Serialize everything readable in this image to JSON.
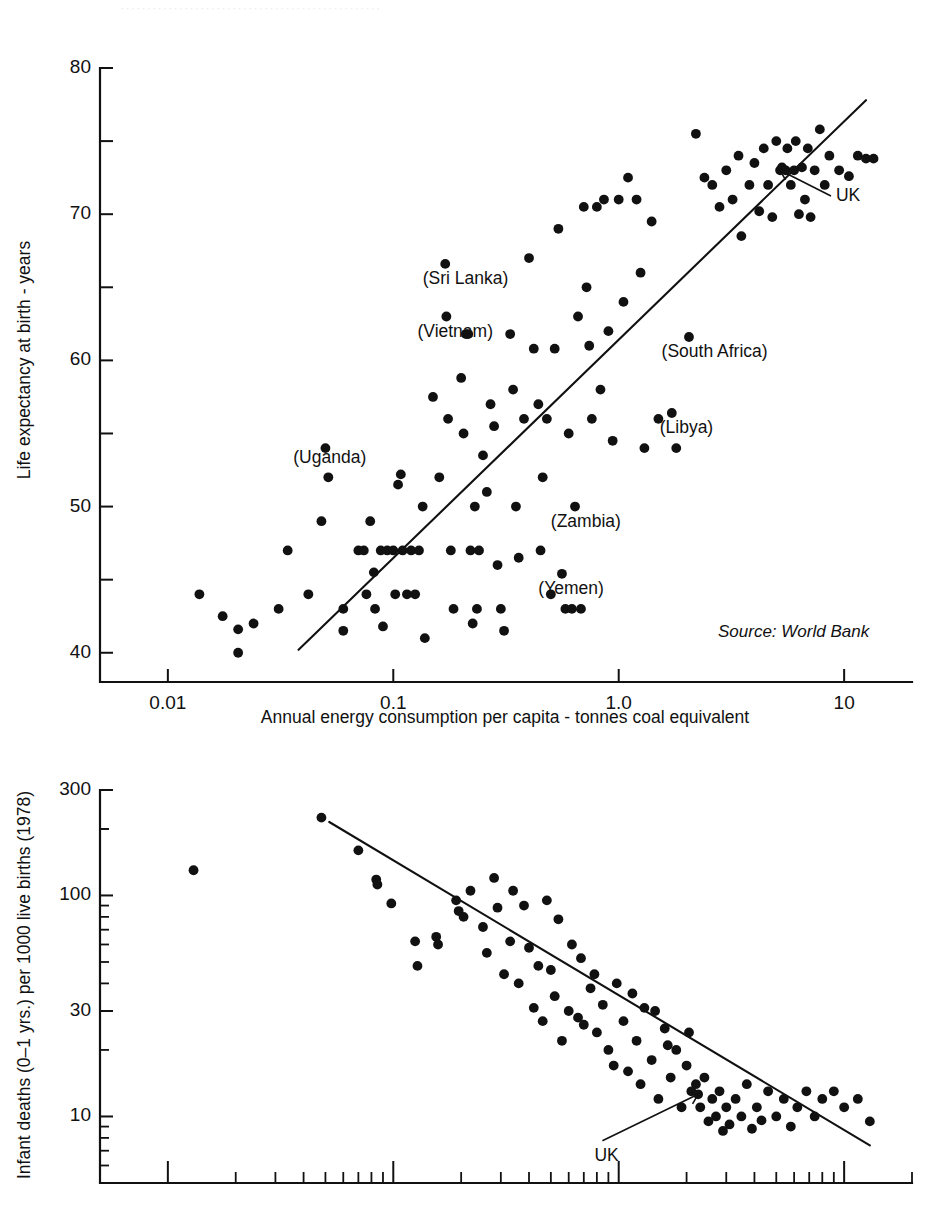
{
  "page": {
    "bleed_through_text": "·················································"
  },
  "chart_data": [
    {
      "id": "life-expectancy",
      "type": "scatter",
      "title": "",
      "xlabel": "Annual energy consumption per capita - tonnes coal equivalent",
      "ylabel": "Life expectancy at birth - years",
      "xscale": "log",
      "yscale": "linear",
      "xlim": [
        0.005,
        20
      ],
      "ylim": [
        38,
        80
      ],
      "xticks": [
        0.01,
        0.1,
        1.0,
        10
      ],
      "xticklabels": [
        "0.01",
        "0.1",
        "1.0",
        "10"
      ],
      "yticks": [
        40,
        45,
        50,
        55,
        60,
        65,
        70,
        75,
        80
      ],
      "yticklabels": [
        "40",
        "",
        "50",
        "",
        "60",
        "",
        "70",
        "",
        "80"
      ],
      "grid": false,
      "source_note": "Source: World Bank",
      "fit_line": {
        "x0": 0.038,
        "y0": 40.2,
        "x1": 12.5,
        "y1": 77.8
      },
      "annotations": [
        {
          "label": "(Sri Lanka)",
          "text_x": 0.135,
          "text_y": 65.2,
          "point_x": 0.175,
          "point_y": 66.6,
          "arrow": false
        },
        {
          "label": "(Vietnam)",
          "text_x": 0.128,
          "text_y": 61.6,
          "point_x": 0.168,
          "point_y": 63.0,
          "arrow": false
        },
        {
          "label": "(South Africa)",
          "text_x": 1.55,
          "text_y": 60.2,
          "point_x": 2.05,
          "point_y": 61.6,
          "arrow": false
        },
        {
          "label": "(Libya)",
          "text_x": 1.52,
          "text_y": 55.0,
          "point_x": 1.72,
          "point_y": 56.4,
          "arrow": false
        },
        {
          "label": "(Uganda)",
          "text_x": 0.036,
          "text_y": 53.0,
          "point_x": 0.05,
          "point_y": 54.2,
          "arrow": false
        },
        {
          "label": "(Zambia)",
          "text_x": 0.5,
          "text_y": 48.6,
          "point_x": 0.64,
          "point_y": 50.0,
          "arrow": false
        },
        {
          "label": "(Yemen)",
          "text_x": 0.44,
          "text_y": 44.0,
          "point_x": 0.56,
          "point_y": 45.4,
          "arrow": false
        },
        {
          "label": "UK",
          "text_x": 9.2,
          "text_y": 70.9,
          "point_x": 5.2,
          "point_y": 73.0,
          "arrow": true
        }
      ],
      "points": [
        [
          0.0138,
          44.0
        ],
        [
          0.0175,
          42.5
        ],
        [
          0.0205,
          41.6
        ],
        [
          0.0205,
          40.0
        ],
        [
          0.024,
          42.0
        ],
        [
          0.031,
          43.0
        ],
        [
          0.034,
          47.0
        ],
        [
          0.042,
          44.0
        ],
        [
          0.048,
          49.0
        ],
        [
          0.05,
          54.0
        ],
        [
          0.0515,
          52.0
        ],
        [
          0.06,
          43.0
        ],
        [
          0.06,
          41.5
        ],
        [
          0.07,
          47.0
        ],
        [
          0.074,
          47.0
        ],
        [
          0.076,
          44.0
        ],
        [
          0.079,
          49.0
        ],
        [
          0.082,
          45.5
        ],
        [
          0.083,
          43.0
        ],
        [
          0.088,
          47.0
        ],
        [
          0.094,
          47.0
        ],
        [
          0.1,
          47.0
        ],
        [
          0.102,
          44.0
        ],
        [
          0.105,
          51.5
        ],
        [
          0.108,
          52.2
        ],
        [
          0.11,
          47.0
        ],
        [
          0.115,
          44.0
        ],
        [
          0.12,
          47.0
        ],
        [
          0.125,
          44.0
        ],
        [
          0.13,
          47.0
        ],
        [
          0.135,
          50.0
        ],
        [
          0.138,
          41.0
        ],
        [
          0.15,
          57.5
        ],
        [
          0.17,
          66.6
        ],
        [
          0.172,
          63.0
        ],
        [
          0.175,
          56.0
        ],
        [
          0.18,
          47.0
        ],
        [
          0.185,
          43.0
        ],
        [
          0.2,
          58.8
        ],
        [
          0.205,
          55.0
        ],
        [
          0.21,
          61.8
        ],
        [
          0.215,
          61.8
        ],
        [
          0.225,
          42.0
        ],
        [
          0.235,
          43.0
        ],
        [
          0.24,
          47.0
        ],
        [
          0.25,
          53.5
        ],
        [
          0.26,
          51.0
        ],
        [
          0.27,
          57.0
        ],
        [
          0.28,
          55.5
        ],
        [
          0.29,
          46.0
        ],
        [
          0.3,
          43.0
        ],
        [
          0.31,
          41.5
        ],
        [
          0.33,
          61.8
        ],
        [
          0.34,
          58.0
        ],
        [
          0.35,
          50.0
        ],
        [
          0.38,
          56.0
        ],
        [
          0.4,
          67.0
        ],
        [
          0.42,
          60.8
        ],
        [
          0.44,
          57.0
        ],
        [
          0.46,
          52.0
        ],
        [
          0.48,
          56.0
        ],
        [
          0.5,
          44.0
        ],
        [
          0.52,
          60.8
        ],
        [
          0.54,
          69.0
        ],
        [
          0.56,
          45.4
        ],
        [
          0.58,
          43.0
        ],
        [
          0.6,
          55.0
        ],
        [
          0.62,
          43.0
        ],
        [
          0.64,
          50.0
        ],
        [
          0.66,
          63.0
        ],
        [
          0.68,
          43.0
        ],
        [
          0.7,
          70.5
        ],
        [
          0.72,
          65.0
        ],
        [
          0.74,
          61.0
        ],
        [
          0.76,
          56.0
        ],
        [
          0.8,
          70.5
        ],
        [
          0.83,
          58.0
        ],
        [
          0.86,
          71.0
        ],
        [
          0.9,
          62.0
        ],
        [
          0.94,
          54.5
        ],
        [
          1.0,
          71.0
        ],
        [
          1.05,
          64.0
        ],
        [
          1.1,
          72.5
        ],
        [
          1.2,
          71.0
        ],
        [
          1.25,
          66.0
        ],
        [
          1.3,
          54.0
        ],
        [
          1.4,
          69.5
        ],
        [
          1.5,
          56.0
        ],
        [
          1.72,
          56.4
        ],
        [
          1.8,
          54.0
        ],
        [
          2.05,
          61.6
        ],
        [
          2.2,
          75.5
        ],
        [
          2.4,
          72.5
        ],
        [
          2.6,
          72.0
        ],
        [
          2.8,
          70.5
        ],
        [
          3.0,
          73.0
        ],
        [
          3.2,
          71.0
        ],
        [
          3.4,
          74.0
        ],
        [
          3.5,
          68.5
        ],
        [
          3.8,
          72.0
        ],
        [
          4.0,
          73.5
        ],
        [
          4.2,
          70.2
        ],
        [
          4.4,
          74.5
        ],
        [
          4.6,
          72.0
        ],
        [
          4.8,
          69.8
        ],
        [
          5.0,
          75.0
        ],
        [
          5.2,
          73.0
        ],
        [
          5.3,
          73.2
        ],
        [
          5.5,
          73.0
        ],
        [
          5.6,
          74.5
        ],
        [
          5.8,
          72.0
        ],
        [
          6.0,
          73.0
        ],
        [
          6.1,
          75.0
        ],
        [
          6.3,
          70.0
        ],
        [
          6.5,
          73.2
        ],
        [
          6.7,
          71.0
        ],
        [
          6.9,
          74.5
        ],
        [
          7.1,
          69.8
        ],
        [
          7.4,
          73.0
        ],
        [
          7.8,
          75.8
        ],
        [
          8.2,
          72.0
        ],
        [
          8.6,
          74.0
        ],
        [
          9.5,
          73.0
        ],
        [
          10.5,
          72.6
        ],
        [
          11.5,
          74.0
        ],
        [
          12.5,
          73.8
        ],
        [
          13.5,
          73.8
        ],
        [
          0.09,
          41.8
        ],
        [
          0.45,
          47.0
        ],
        [
          0.22,
          47.0
        ],
        [
          0.16,
          52.0
        ],
        [
          0.36,
          46.5
        ],
        [
          0.23,
          50.0
        ]
      ]
    },
    {
      "id": "infant-mortality",
      "type": "scatter",
      "title": "",
      "xlabel": "",
      "ylabel": "Infant deaths (0–1 yrs.) per 1000 live births (1978)",
      "xscale": "log",
      "yscale": "log",
      "xlim": [
        0.005,
        20
      ],
      "ylim": [
        5,
        300
      ],
      "xticks": [],
      "xticklabels": [],
      "yticks": [
        300,
        100,
        30,
        10
      ],
      "yticklabels": [
        "300",
        "100",
        "30",
        "10"
      ],
      "grid": false,
      "fit_line": {
        "x0": 0.052,
        "y0": 215,
        "x1": 13.0,
        "y1": 7.4
      },
      "annotations": [
        {
          "label": "UK",
          "text_x": 0.78,
          "text_y": 6.3,
          "point_x": 2.25,
          "point_y": 12.6,
          "arrow": true
        }
      ],
      "points": [
        [
          0.013,
          130
        ],
        [
          0.048,
          225
        ],
        [
          0.07,
          160
        ],
        [
          0.084,
          118
        ],
        [
          0.085,
          112
        ],
        [
          0.098,
          92
        ],
        [
          0.125,
          62
        ],
        [
          0.128,
          48
        ],
        [
          0.155,
          65
        ],
        [
          0.158,
          60
        ],
        [
          0.19,
          95
        ],
        [
          0.195,
          85
        ],
        [
          0.205,
          80
        ],
        [
          0.22,
          105
        ],
        [
          0.25,
          72
        ],
        [
          0.26,
          55
        ],
        [
          0.29,
          88
        ],
        [
          0.31,
          44
        ],
        [
          0.33,
          62
        ],
        [
          0.36,
          40
        ],
        [
          0.4,
          58
        ],
        [
          0.42,
          31
        ],
        [
          0.44,
          48
        ],
        [
          0.46,
          27
        ],
        [
          0.5,
          46
        ],
        [
          0.52,
          35
        ],
        [
          0.56,
          22
        ],
        [
          0.6,
          30
        ],
        [
          0.62,
          60
        ],
        [
          0.66,
          28
        ],
        [
          0.7,
          26
        ],
        [
          0.75,
          38
        ],
        [
          0.8,
          24
        ],
        [
          0.85,
          32
        ],
        [
          0.9,
          20
        ],
        [
          0.95,
          17
        ],
        [
          1.05,
          27
        ],
        [
          1.1,
          16
        ],
        [
          1.2,
          22
        ],
        [
          1.25,
          14
        ],
        [
          1.3,
          31
        ],
        [
          1.4,
          18
        ],
        [
          1.5,
          12
        ],
        [
          1.6,
          25
        ],
        [
          1.7,
          15
        ],
        [
          1.8,
          20
        ],
        [
          1.9,
          11
        ],
        [
          2.0,
          17
        ],
        [
          2.1,
          13
        ],
        [
          2.2,
          14
        ],
        [
          2.25,
          12.6
        ],
        [
          2.3,
          11
        ],
        [
          2.4,
          15
        ],
        [
          2.5,
          9.5
        ],
        [
          2.6,
          12
        ],
        [
          2.7,
          10
        ],
        [
          2.8,
          13
        ],
        [
          2.9,
          8.6
        ],
        [
          3.0,
          11
        ],
        [
          3.1,
          9.2
        ],
        [
          3.3,
          12
        ],
        [
          3.5,
          10
        ],
        [
          3.7,
          14
        ],
        [
          3.9,
          8.8
        ],
        [
          4.1,
          11
        ],
        [
          4.3,
          9.6
        ],
        [
          4.6,
          13
        ],
        [
          5.0,
          10
        ],
        [
          5.4,
          12
        ],
        [
          5.8,
          9
        ],
        [
          6.2,
          11
        ],
        [
          6.8,
          13
        ],
        [
          7.4,
          10
        ],
        [
          8.0,
          12
        ],
        [
          9.0,
          13
        ],
        [
          10.0,
          11
        ],
        [
          11.5,
          12
        ],
        [
          13.0,
          9.5
        ],
        [
          0.38,
          90
        ],
        [
          0.48,
          95
        ],
        [
          0.54,
          78
        ],
        [
          0.34,
          105
        ],
        [
          0.68,
          52
        ],
        [
          0.78,
          44
        ],
        [
          1.15,
          36
        ],
        [
          1.45,
          30
        ],
        [
          2.05,
          24
        ],
        [
          0.98,
          40
        ],
        [
          1.65,
          21
        ],
        [
          0.28,
          120
        ]
      ]
    }
  ]
}
